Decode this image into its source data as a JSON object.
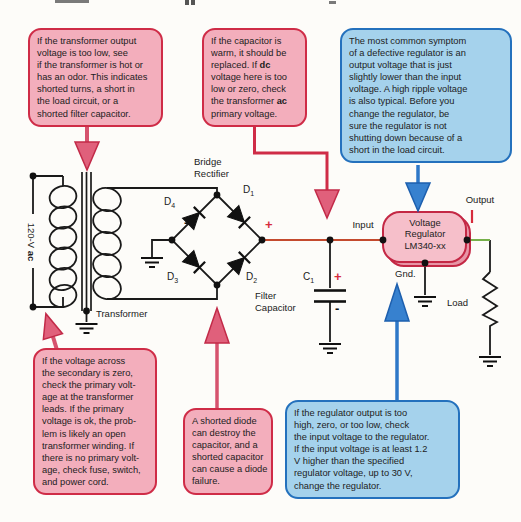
{
  "callouts": {
    "transformer_output": {
      "text": "If the transformer output\nvoltage is too low, see\nif the transformer is hot or\nhas an odor. This indicates\nshorted turns, a short in\nthe load circuit, or a\nshorted filter capacitor."
    },
    "capacitor_warm": {
      "seg1": "If the capacitor is\nwarm, it should be\nreplaced. If ",
      "bold1": "dc",
      "seg2": "\nvoltage here is too\nlow or zero, check\nthe transformer ",
      "bold2": "ac",
      "seg3": "\nprimary voltage."
    },
    "defective_regulator": {
      "text": "The most common symptom\nof a defective regulator is an\noutput voltage that is just\nslightly lower than the input\nvoltage. A high ripple voltage\nis also typical. Before you\nchange the regulator, be\nsure the regulator is not\nshutting down because of a\nshort in the load circuit."
    },
    "secondary_zero": {
      "text": "If the voltage across\nthe secondary is zero,\ncheck the primary volt-\nage at the transformer\nleads. If the primary\nvoltage is ok, the prob-\nlem is likely an open\ntransformer winding. If\nthere is no primary volt-\nage, check fuse, switch,\nand power cord."
    },
    "shorted_diode": {
      "text": "A shorted diode\ncan destroy the\ncapacitor, and a\nshorted capacitor\ncan cause a diode\nfailure."
    },
    "regulator_output": {
      "text": "If the regulator output is too\nhigh, zero, or too low, check\nthe input voltage to the regulator.\nIf the input voltage is at least 1.2\nV higher than the specified\nregulator voltage, up to 30 V,\nchange the regulator."
    }
  },
  "circuit": {
    "source_voltage": {
      "prefix": "120-V ",
      "bold": "ac"
    },
    "transformer_label": "Transformer",
    "bridge_label": "Bridge\nRectifier",
    "diodes": {
      "d1": {
        "letter": "D",
        "sub": "1"
      },
      "d2": {
        "letter": "D",
        "sub": "2"
      },
      "d3": {
        "letter": "D",
        "sub": "3"
      },
      "d4": {
        "letter": "D",
        "sub": "4"
      }
    },
    "bridge_plus": "+",
    "bridge_minus": "-",
    "capacitor": {
      "ref": {
        "letter": "C",
        "sub": "1"
      },
      "plus": "+",
      "minus": "-",
      "label": "Filter\nCapacitor"
    },
    "input_label": "Input",
    "output_label": "Output",
    "regulator": {
      "line1": "Voltage",
      "line2": "Regulator",
      "line3": "LM340-xx",
      "gnd": "Gnd."
    },
    "load_label": "Load"
  },
  "colors": {
    "callout_pink_fill": "#f3aebc",
    "callout_pink_border": "#cf2c47",
    "callout_blue_fill": "#a5d2ec",
    "callout_blue_border": "#2471bd",
    "arrow_red": "#e0607b",
    "arrow_blue": "#3781cf",
    "wire_red": "#c44a2e",
    "wire_green": "#76b04a",
    "accent_red": "#d62b3c"
  }
}
